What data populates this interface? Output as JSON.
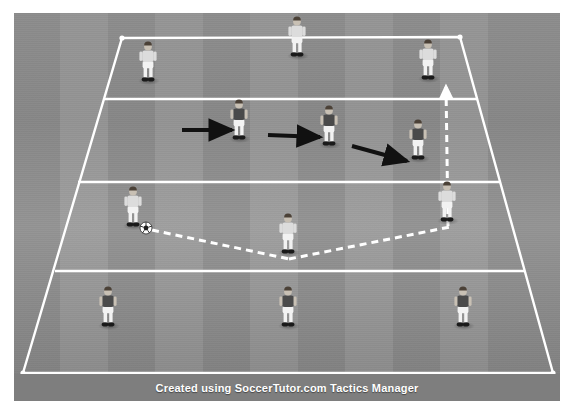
{
  "image": {
    "title": "Soccer Tactics Diagram - Positional Rondo / Pressing Drill",
    "width": 574,
    "height": 415
  },
  "footer": {
    "credit": "Created using SoccerTutor.com Tactics Manager"
  },
  "colors": {
    "pitch": "#8f8f8f",
    "stripe_light": "#9b9b9b",
    "stripe_dark": "#828282",
    "line": "#ffffff",
    "arrow_movement": "#111111",
    "arrow_pass": "#ffffff",
    "footer_bar": "#7e7e7e",
    "kit_white_shirt": "#dcdcdc",
    "kit_dark_shirt": "#4a4a4a",
    "shorts_white": "#f2f2f2",
    "skin": "#c8c0b4",
    "boots": "#1a1a1a"
  },
  "grid": {
    "name": "playing-area",
    "corners": {
      "top_left": [
        122,
        38
      ],
      "top_right": [
        460,
        37
      ],
      "bottom_right": [
        553,
        373
      ],
      "bottom_left": [
        23,
        373
      ]
    },
    "divider_lines": [
      {
        "label": "line-1",
        "x1": 104,
        "y1": 99,
        "x2": 478,
        "y2": 99
      },
      {
        "label": "line-2",
        "x1": 78,
        "y1": 182,
        "x2": 501,
        "y2": 182
      },
      {
        "label": "line-3",
        "x1": 55,
        "y1": 271,
        "x2": 524,
        "y2": 271
      }
    ]
  },
  "players": [
    {
      "id": "p1",
      "team": "white",
      "label": "white-player-top-left",
      "x": 148,
      "y": 60
    },
    {
      "id": "p2",
      "team": "white",
      "label": "white-player-top-center",
      "x": 297,
      "y": 35
    },
    {
      "id": "p3",
      "team": "white",
      "label": "white-player-top-right",
      "x": 428,
      "y": 58
    },
    {
      "id": "p4",
      "team": "dark",
      "label": "dark-player-mid-left",
      "x": 239,
      "y": 118
    },
    {
      "id": "p5",
      "team": "dark",
      "label": "dark-player-mid-center",
      "x": 329,
      "y": 124
    },
    {
      "id": "p6",
      "team": "dark",
      "label": "dark-player-mid-right",
      "x": 418,
      "y": 138
    },
    {
      "id": "p7",
      "team": "white",
      "label": "white-player-ball-carrier",
      "x": 133,
      "y": 205
    },
    {
      "id": "p8",
      "team": "white",
      "label": "white-player-center-low",
      "x": 288,
      "y": 232
    },
    {
      "id": "p9",
      "team": "white",
      "label": "white-player-right-low",
      "x": 447,
      "y": 200
    },
    {
      "id": "p10",
      "team": "dark",
      "label": "dark-player-bottom-left",
      "x": 108,
      "y": 305
    },
    {
      "id": "p11",
      "team": "dark",
      "label": "dark-player-bottom-center",
      "x": 288,
      "y": 305
    },
    {
      "id": "p12",
      "team": "dark",
      "label": "dark-player-bottom-right",
      "x": 463,
      "y": 305
    }
  ],
  "ball": {
    "label": "soccer-ball",
    "x": 146,
    "y": 228,
    "radius": 6
  },
  "movement_arrows": [
    {
      "label": "press-arrow-1",
      "x1": 182,
      "y1": 130,
      "x2": 232,
      "y2": 130
    },
    {
      "label": "press-arrow-2",
      "x1": 268,
      "y1": 135,
      "x2": 320,
      "y2": 137
    },
    {
      "label": "press-arrow-3",
      "x1": 352,
      "y1": 146,
      "x2": 407,
      "y2": 161
    }
  ],
  "pass_lines": [
    {
      "label": "pass-left-to-center",
      "x1": 152,
      "y1": 230,
      "x2": 289,
      "y2": 259
    },
    {
      "label": "pass-center-to-right",
      "x1": 289,
      "y1": 259,
      "x2": 450,
      "y2": 227
    }
  ],
  "run_arrows": [
    {
      "label": "run-arrow-up-right",
      "x1": 448,
      "y1": 226,
      "x2": 446,
      "y2": 86
    }
  ],
  "stripes": [
    {
      "x": 0,
      "w": 46,
      "tone": "dark"
    },
    {
      "x": 46,
      "w": 48,
      "tone": "light"
    },
    {
      "x": 94,
      "w": 47,
      "tone": "dark"
    },
    {
      "x": 141,
      "w": 48,
      "tone": "light"
    },
    {
      "x": 189,
      "w": 47,
      "tone": "dark"
    },
    {
      "x": 236,
      "w": 48,
      "tone": "light"
    },
    {
      "x": 284,
      "w": 47,
      "tone": "dark"
    },
    {
      "x": 331,
      "w": 48,
      "tone": "light"
    },
    {
      "x": 379,
      "w": 47,
      "tone": "dark"
    },
    {
      "x": 426,
      "w": 48,
      "tone": "light"
    },
    {
      "x": 474,
      "w": 72,
      "tone": "dark"
    }
  ]
}
